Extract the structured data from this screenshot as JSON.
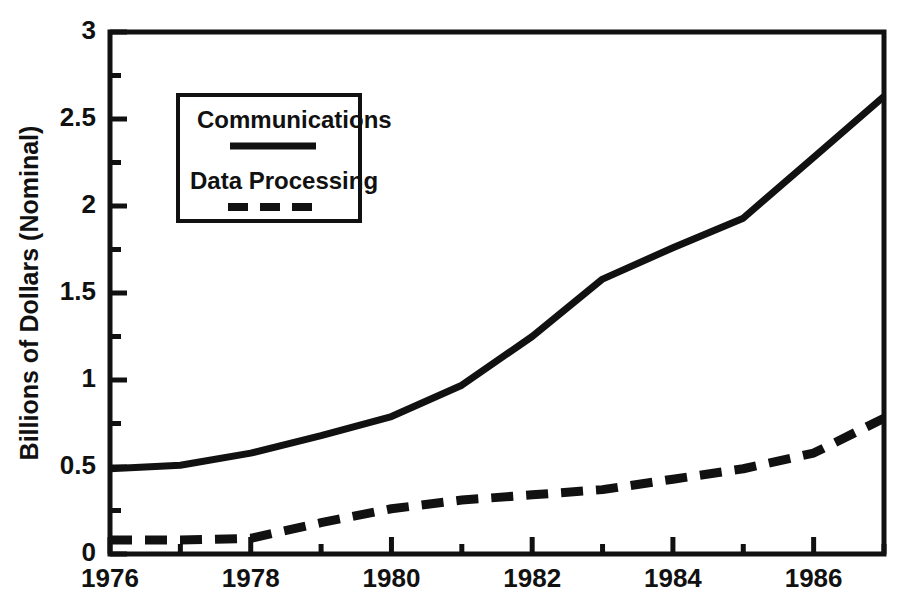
{
  "chart_data": {
    "type": "line",
    "title": "",
    "xlabel": "",
    "ylabel": "Billions of Dollars (Nominal)",
    "xlim": [
      1976,
      1987
    ],
    "ylim": [
      0,
      3
    ],
    "grid": false,
    "legend_position": "upper-left-inside",
    "x_tick_labels": [
      "1976",
      "1978",
      "1980",
      "1982",
      "1984",
      "1986"
    ],
    "x_tick_values": [
      1976,
      1978,
      1980,
      1982,
      1984,
      1986
    ],
    "x_minor_tick_values": [
      1977,
      1979,
      1981,
      1983,
      1985,
      1987
    ],
    "y_tick_labels": [
      "0",
      "0.5",
      "1",
      "1.5",
      "2",
      "2.5",
      "3"
    ],
    "y_tick_values": [
      0,
      0.5,
      1,
      1.5,
      2,
      2.5,
      3
    ],
    "y_minor_tick_values": [
      0.25,
      0.75,
      1.25,
      1.75,
      2.25,
      2.75
    ],
    "x": [
      1976,
      1977,
      1978,
      1979,
      1980,
      1981,
      1982,
      1983,
      1984,
      1985,
      1986,
      1987
    ],
    "series": [
      {
        "name": "Communications",
        "style": "solid",
        "color": "#111111",
        "values": [
          0.49,
          0.51,
          0.58,
          0.68,
          0.79,
          0.97,
          1.25,
          1.58,
          1.76,
          1.93,
          2.28,
          2.63
        ]
      },
      {
        "name": "Data Processing",
        "style": "dashed",
        "color": "#111111",
        "values": [
          0.08,
          0.08,
          0.09,
          0.18,
          0.26,
          0.31,
          0.34,
          0.37,
          0.43,
          0.49,
          0.58,
          0.78
        ]
      }
    ]
  },
  "legend": {
    "entries": [
      {
        "label": "Communications",
        "style": "solid"
      },
      {
        "label": "Data Processing",
        "style": "dashed"
      }
    ]
  }
}
